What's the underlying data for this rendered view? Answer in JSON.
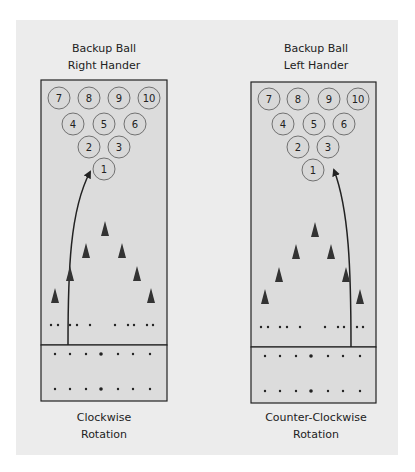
{
  "diagrams": [
    {
      "title_line1": "Backup Ball",
      "title_line2": "Right Hander",
      "caption_line1": "Clockwise",
      "caption_line2": "Rotation",
      "pins": [
        "7",
        "8",
        "9",
        "10",
        "4",
        "5",
        "6",
        "2",
        "3",
        "1"
      ]
    },
    {
      "title_line1": "Backup Ball",
      "title_line2": "Left Hander",
      "caption_line1": "Counter-Clockwise",
      "caption_line2": "Rotation",
      "pins": [
        "7",
        "8",
        "9",
        "10",
        "4",
        "5",
        "6",
        "2",
        "3",
        "1"
      ]
    }
  ],
  "colors": {
    "panel": "#ececec",
    "lane": "#dcdcdc",
    "pin_fill": "#d8d8d8",
    "line": "#222222",
    "arrow_marker": "#333333"
  }
}
